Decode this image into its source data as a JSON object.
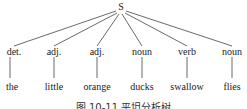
{
  "tree": {
    "root": "S",
    "nodes": [
      {
        "pos": "det.",
        "word": "the",
        "x": 14
      },
      {
        "pos": "adj.",
        "word": "little",
        "x": 54
      },
      {
        "pos": "adj.",
        "word": "orange",
        "x": 97
      },
      {
        "pos": "noun",
        "word": "ducks",
        "x": 142
      },
      {
        "pos": "verb",
        "word": "swallow",
        "x": 187
      },
      {
        "pos": "noun",
        "word": "flies",
        "x": 232
      }
    ]
  },
  "caption": "图 10-11 平坦分析树"
}
